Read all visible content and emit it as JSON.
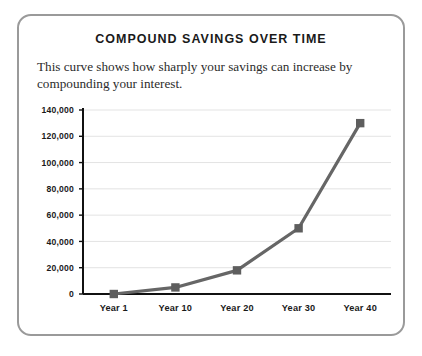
{
  "card": {
    "border_color": "#9a9a9a"
  },
  "chart_data": {
    "type": "line",
    "title": "Compound Savings Over Time",
    "subtitle": "This curve shows how sharply your savings can increase by compounding your interest.",
    "categories": [
      "Year 1",
      "Year 10",
      "Year 20",
      "Year 30",
      "Year 40"
    ],
    "values": [
      0,
      5000,
      18000,
      50000,
      130000
    ],
    "series": [
      {
        "name": "Compound Savings",
        "values": [
          0,
          5000,
          18000,
          50000,
          130000
        ],
        "color": "#666666",
        "marker_color": "#5e5e5e",
        "marker": "square"
      }
    ],
    "xlabel": "",
    "ylabel": "",
    "ylim": [
      0,
      140000
    ],
    "ytick_values": [
      0,
      20000,
      40000,
      60000,
      80000,
      100000,
      120000,
      140000
    ],
    "ytick_labels": [
      "0",
      "20,000",
      "40,000",
      "60,000",
      "80,000",
      "100,000",
      "120,000",
      "140,000"
    ],
    "grid": true,
    "grid_color": "#e3e3e3",
    "axis_color": "#111111",
    "legend": false,
    "legend_position": "none"
  }
}
